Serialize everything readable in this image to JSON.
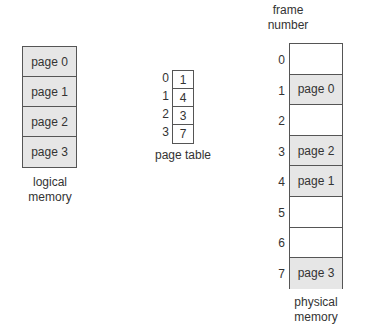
{
  "logical_memory": {
    "label_line1": "logical",
    "label_line2": "memory",
    "pages": [
      "page 0",
      "page 1",
      "page 2",
      "page 3"
    ]
  },
  "page_table": {
    "label": "page table",
    "indices": [
      "0",
      "1",
      "2",
      "3"
    ],
    "entries": [
      "1",
      "4",
      "3",
      "7"
    ]
  },
  "physical_memory": {
    "header_line1": "frame",
    "header_line2": "number",
    "label_line1": "physical",
    "label_line2": "memory",
    "frames": [
      {
        "number": "0",
        "content": ""
      },
      {
        "number": "1",
        "content": "page 0"
      },
      {
        "number": "2",
        "content": ""
      },
      {
        "number": "3",
        "content": "page 2"
      },
      {
        "number": "4",
        "content": "page 1"
      },
      {
        "number": "5",
        "content": ""
      },
      {
        "number": "6",
        "content": ""
      },
      {
        "number": "7",
        "content": "page 3"
      }
    ]
  },
  "colors": {
    "filled": "#e6e6e6",
    "empty": "#ffffff",
    "border": "#555555"
  }
}
